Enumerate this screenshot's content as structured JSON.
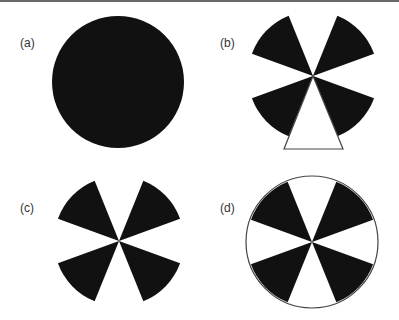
{
  "figure": {
    "panels": [
      {
        "id": "a",
        "label": "(a)",
        "description": "solid black disc"
      },
      {
        "id": "b",
        "label": "(b)",
        "description": "four black sectors with white triangle filling the bottom gap"
      },
      {
        "id": "c",
        "label": "(c)",
        "description": "four black sectors on white background"
      },
      {
        "id": "d",
        "label": "(d)",
        "description": "four black sectors inside an outlined circle"
      }
    ],
    "colors": {
      "fill": "#111111",
      "outline": "#444444",
      "background": "#ffffff",
      "top_rule": "#6a6a6a"
    },
    "sector_angles_deg": [
      [
        20,
        68
      ],
      [
        112,
        160
      ],
      [
        200,
        248
      ],
      [
        292,
        340
      ]
    ],
    "radius_px": 65
  }
}
